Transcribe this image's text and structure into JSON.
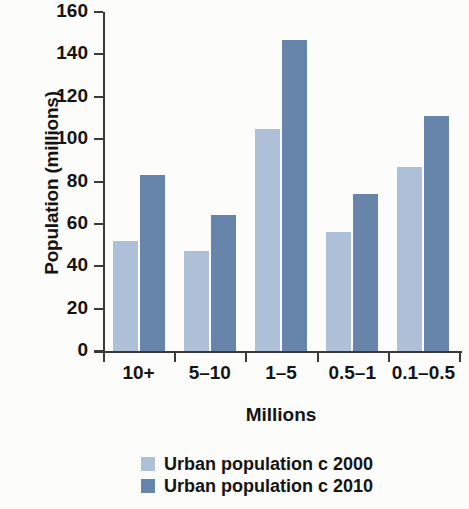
{
  "chart_data": {
    "type": "bar",
    "title": "",
    "subtitle": "",
    "xlabel": "Millions",
    "ylabel": "Population (millions)",
    "categories": [
      "10+",
      "5–10",
      "1–5",
      "0.5–1",
      "0.1–0.5"
    ],
    "series": [
      {
        "name": "Urban population c 2000",
        "color": "#aec0d8",
        "values": [
          52,
          47,
          105,
          56,
          87
        ]
      },
      {
        "name": "Urban population c 2010",
        "color": "#6784ab",
        "values": [
          83,
          64,
          147,
          74,
          111
        ]
      }
    ],
    "ylim": [
      0,
      160
    ],
    "ytick_labels": [
      "160",
      "140",
      "120",
      "100",
      "80",
      "60",
      "40",
      "20",
      "0"
    ],
    "ytick_values": [
      160,
      140,
      120,
      100,
      80,
      60,
      40,
      20,
      0
    ],
    "ytick_step": 20,
    "grid": false,
    "legend_position": "bottom-center",
    "axis_color": "#3a3a3a",
    "background_color": "#fcfcfa"
  },
  "legend": {
    "entries": [
      {
        "label": "Urban population c 2000",
        "color": "#aec0d8"
      },
      {
        "label": "Urban population c 2010",
        "color": "#6784ab"
      }
    ]
  }
}
